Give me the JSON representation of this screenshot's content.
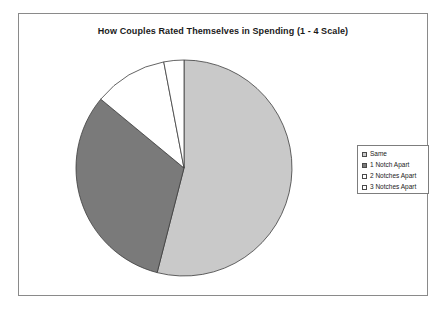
{
  "frame": {
    "border_color": "#8a8a8a"
  },
  "chart_data": {
    "type": "pie",
    "title": "How Couples Rated Themselves in Spending (1 - 4 Scale)",
    "xlabel": "",
    "ylabel": "",
    "legend_position": "right",
    "grid": false,
    "start_angle_deg": 0,
    "direction": "clockwise",
    "categories": [
      "Same",
      "1 Notch Apart",
      "2 Notches Apart",
      "3 Notches Apart"
    ],
    "values": [
      54,
      32,
      11,
      3
    ],
    "units": "percent",
    "slices": [
      {
        "label": "Same",
        "value": 54,
        "start_deg": 0,
        "end_deg": 194.4,
        "fill": "#c9c9c9",
        "stroke": "#3c3c3c",
        "swatch_fill": "#c9c9c9"
      },
      {
        "label": "1 Notch Apart",
        "value": 32,
        "start_deg": 194.4,
        "end_deg": 309.6,
        "fill": "#7a7a7a",
        "stroke": "#3c3c3c",
        "swatch_fill": "#7a7a7a"
      },
      {
        "label": "2 Notches Apart",
        "value": 11,
        "start_deg": 309.6,
        "end_deg": 349.2,
        "fill": "#ffffff",
        "stroke": "#3c3c3c",
        "swatch_fill": "#ffffff"
      },
      {
        "label": "3 Notches Apart",
        "value": 3,
        "start_deg": 349.2,
        "end_deg": 360,
        "fill": "#ffffff",
        "stroke": "#3c3c3c",
        "swatch_fill": "#ffffff"
      }
    ]
  },
  "legend": {
    "entries": [
      {
        "label": "Same"
      },
      {
        "label": "1 Notch Apart"
      },
      {
        "label": "2 Notches Apart"
      },
      {
        "label": "3 Notches Apart"
      }
    ]
  }
}
